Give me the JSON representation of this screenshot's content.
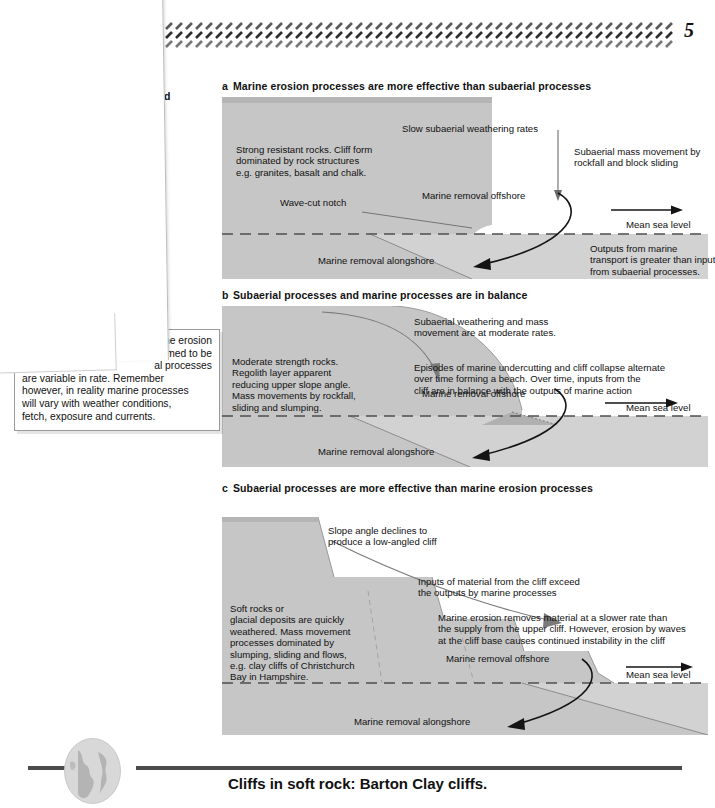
{
  "page": {
    "number": "5",
    "header_pattern": "hatched-band"
  },
  "margin_note": {
    "visible_fragment_line1": "e",
    "visible_fragment_line2": "rial and"
  },
  "note_box": {
    "line1": "marine erosion",
    "line2": "umed to be",
    "line3": "al processes",
    "line4": "are variable in rate. Remember",
    "line5": "however, in reality marine processes",
    "line6": "will vary with weather conditions,",
    "line7": "fetch, exposure and currents.",
    "occluded_fragment": "constant"
  },
  "diagrams": [
    {
      "letter": "a",
      "title": "Marine erosion processes are more effective than subaerial processes",
      "labels": {
        "rock_block": "Strong resistant rocks. Cliff form\ndominated by rock structures\ne.g. granites, basalt and chalk.",
        "weathering": "Slow subaerial weathering rates",
        "mass_movement": "Subaerial mass movement by\nrockfall and block sliding",
        "notch": "Wave-cut notch",
        "removal_offshore": "Marine removal offshore",
        "sea_level": "Mean sea level",
        "removal_alongshore": "Marine removal alongshore",
        "outputs": "Outputs from marine\ntransport is greater than input\nfrom subaerial processes."
      }
    },
    {
      "letter": "b",
      "title": "Subaerial processes and marine processes are in balance",
      "labels": {
        "weathering": "Subaerial weathering and mass\nmovement are at moderate rates.",
        "rock_block": "Moderate strength rocks.\nRegolith layer apparent\nreducing upper slope angle.\nMass movements by rockfall,\nsliding and slumping.",
        "episodes": "Episodes of marine undercutting and cliff collapse alternate\nover time forming a beach. Over time, inputs from the\ncliff are in balance with the outputs of marine action",
        "removal_offshore": "Marine removal offshore",
        "sea_level": "Mean sea level",
        "removal_alongshore": "Marine removal alongshore"
      }
    },
    {
      "letter": "c",
      "title": "Subaerial processes are more effective than marine erosion processes",
      "labels": {
        "slope_angle": "Slope angle declines to\nproduce a low-angled cliff",
        "inputs": "Inputs of material from the cliff exceed\nthe outputs by marine processes",
        "rock_block": "Soft rocks or\nglacial deposits are quickly\nweathered. Mass movement\nprocesses dominated by\nslumping, sliding and flows,\ne.g. clay cliffs of Christchurch\nBay in Hampshire.",
        "erosion": "Marine erosion removes material at a slower rate than\nthe supply from the upper cliff. However, erosion by waves\nat the cliff base causes continued instability in the cliff",
        "removal_offshore": "Marine removal offshore",
        "sea_level": "Mean sea level",
        "removal_alongshore": "Marine removal alongshore"
      }
    }
  ],
  "footer": {
    "caption": "Cliffs in soft rock: Barton Clay cliffs.",
    "globe_icon": "globe-icon"
  },
  "colors": {
    "cliff_fill": "#c6c6c6",
    "sea_fill": "#d2d2d2",
    "outline": "#8c8c8c",
    "rule": "#4b4b4b",
    "text": "#111111"
  }
}
